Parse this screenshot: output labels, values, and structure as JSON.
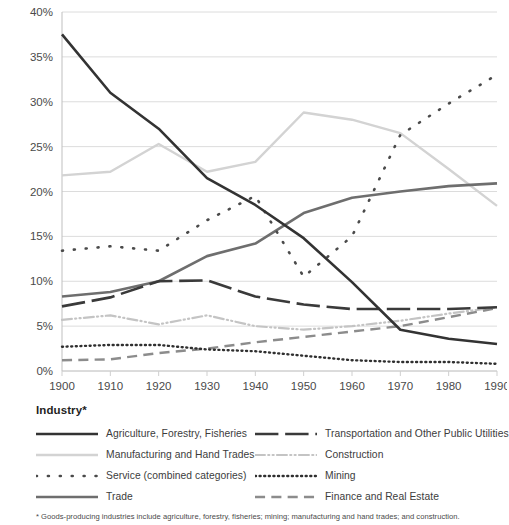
{
  "chart_data": {
    "type": "line",
    "title": "",
    "xlabel": "",
    "ylabel": "",
    "x": [
      1900,
      1910,
      1920,
      1930,
      1940,
      1950,
      1960,
      1970,
      1980,
      1990
    ],
    "xlim": [
      1900,
      1990
    ],
    "ylim": [
      0,
      40
    ],
    "ytick_labels": [
      "0%",
      "5%",
      "10%",
      "15%",
      "20%",
      "25%",
      "30%",
      "35%",
      "40%"
    ],
    "ytick_values": [
      0,
      5,
      10,
      15,
      20,
      25,
      30,
      35,
      40
    ],
    "xtick_labels": [
      "1900",
      "1910",
      "1920",
      "1930",
      "1940",
      "1950",
      "1960",
      "1970",
      "1980",
      "1990"
    ],
    "grid": "horizontal",
    "legend_position": "below",
    "series": [
      {
        "name": "Agriculture, Forestry, Fisheries",
        "values": [
          37.5,
          31.0,
          27.0,
          21.5,
          18.5,
          14.8,
          9.9,
          4.6,
          3.6,
          3.0
        ],
        "color": "#333333",
        "style": "solid",
        "width": 2.6
      },
      {
        "name": "Manufacturing and Hand Trades",
        "values": [
          21.8,
          22.2,
          25.3,
          22.2,
          23.3,
          28.8,
          28.0,
          26.5,
          22.5,
          18.4
        ],
        "color": "#d3d3d3",
        "style": "solid",
        "width": 2.4
      },
      {
        "name": "Service (combined categories)",
        "values": [
          13.4,
          13.9,
          13.4,
          16.8,
          19.5,
          10.5,
          15.0,
          26.3,
          29.8,
          33.0
        ],
        "color": "#4a4a4a",
        "style": "dotted",
        "width": 2.6
      },
      {
        "name": "Trade",
        "values": [
          8.3,
          8.8,
          10.0,
          12.8,
          14.2,
          17.6,
          19.3,
          20.0,
          20.6,
          20.9
        ],
        "color": "#6e6e6e",
        "style": "solid",
        "width": 2.6
      },
      {
        "name": "Transportation and Other Public Utilities",
        "values": [
          7.2,
          8.2,
          10.0,
          10.1,
          8.3,
          7.4,
          6.9,
          6.9,
          6.9,
          7.1
        ],
        "color": "#3a3a3a",
        "style": "dashed-long",
        "width": 2.6
      },
      {
        "name": "Construction",
        "values": [
          5.7,
          6.2,
          5.2,
          6.2,
          5.0,
          4.6,
          5.0,
          5.6,
          6.4,
          7.1
        ],
        "color": "#c4c4c4",
        "style": "dash-dot-dot",
        "width": 2.2
      },
      {
        "name": "Mining",
        "values": [
          2.7,
          2.9,
          2.9,
          2.4,
          2.2,
          1.7,
          1.2,
          1.0,
          1.0,
          0.8
        ],
        "color": "#2f2f2f",
        "style": "dotted-fine",
        "width": 2.4
      },
      {
        "name": "Finance and Real Estate",
        "values": [
          1.2,
          1.3,
          2.0,
          2.5,
          3.2,
          3.8,
          4.4,
          5.0,
          6.0,
          7.0
        ],
        "color": "#8c8c8c",
        "style": "dashed-med",
        "width": 2.4
      }
    ]
  },
  "legend": {
    "title": "Industry*",
    "columns": [
      {
        "items": [
          {
            "label": "Agriculture, Forestry, Fisheries",
            "series": 0
          },
          {
            "label": "Manufacturing and Hand Trades",
            "series": 1
          },
          {
            "label": "Service (combined categories)",
            "series": 2
          },
          {
            "label": "Trade",
            "series": 3
          }
        ]
      },
      {
        "items": [
          {
            "label": "Transportation and Other Public Utilities",
            "series": 4
          },
          {
            "label": "Construction",
            "series": 5
          },
          {
            "label": "Mining",
            "series": 6
          },
          {
            "label": "Finance and Real Estate",
            "series": 7
          }
        ]
      }
    ]
  },
  "footnote": "* Goods-producing industries include agriculture, forestry, fisheries; mining; manufacturing and hand trades; and construction."
}
